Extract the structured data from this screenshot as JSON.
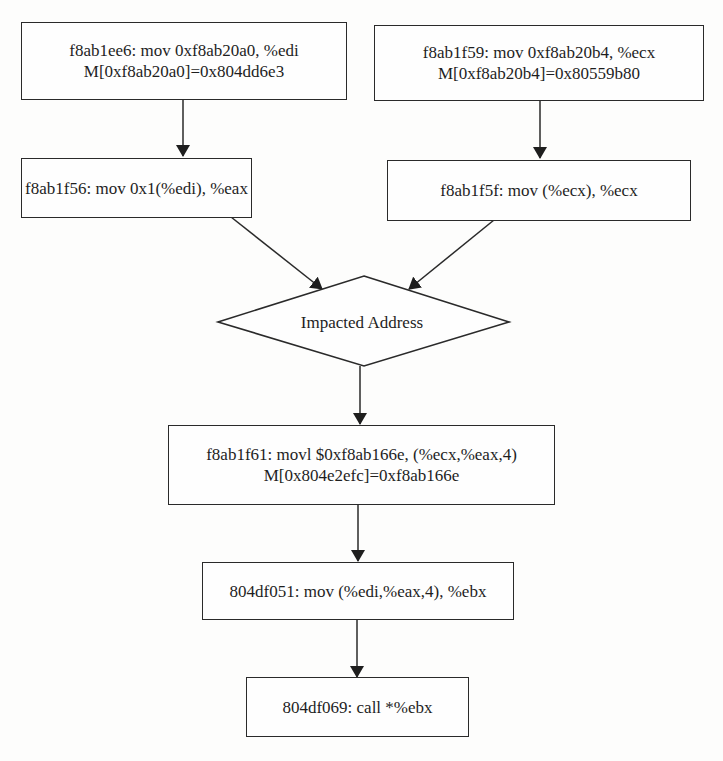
{
  "diagram": {
    "type": "data-flow",
    "colors": {
      "stroke": "#2a2a2a",
      "background": "#fdfdfc",
      "text": "#1e1e1e"
    },
    "nodes": [
      {
        "id": "n1",
        "shape": "rect",
        "lines": [
          "f8ab1ee6: mov 0xf8ab20a0, %edi",
          "M[0xf8ab20a0]=0x804dd6e3"
        ]
      },
      {
        "id": "n2",
        "shape": "rect",
        "lines": [
          "f8ab1f59: mov 0xf8ab20b4, %ecx",
          "M[0xf8ab20b4]=0x80559b80"
        ]
      },
      {
        "id": "n3",
        "shape": "rect",
        "lines": [
          "f8ab1f56: mov 0x1(%edi), %eax"
        ]
      },
      {
        "id": "n4",
        "shape": "rect",
        "lines": [
          "f8ab1f5f: mov (%ecx), %ecx"
        ]
      },
      {
        "id": "n5",
        "shape": "diamond",
        "lines": [
          "Impacted Address"
        ]
      },
      {
        "id": "n6",
        "shape": "rect",
        "lines": [
          "f8ab1f61: movl $0xf8ab166e, (%ecx,%eax,4)",
          "M[0x804e2efc]=0xf8ab166e"
        ]
      },
      {
        "id": "n7",
        "shape": "rect",
        "lines": [
          "804df051: mov (%edi,%eax,4), %ebx"
        ]
      },
      {
        "id": "n8",
        "shape": "rect",
        "lines": [
          "804df069: call *%ebx"
        ]
      }
    ],
    "edges": [
      {
        "from": "n1",
        "to": "n3"
      },
      {
        "from": "n2",
        "to": "n4"
      },
      {
        "from": "n3",
        "to": "n5"
      },
      {
        "from": "n4",
        "to": "n5"
      },
      {
        "from": "n5",
        "to": "n6"
      },
      {
        "from": "n6",
        "to": "n7"
      },
      {
        "from": "n7",
        "to": "n8"
      }
    ]
  }
}
